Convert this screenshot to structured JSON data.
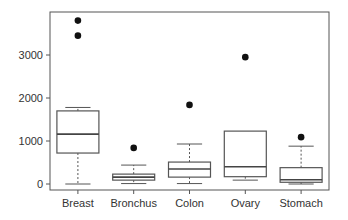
{
  "chart_data": {
    "type": "boxplot",
    "title": "",
    "xlabel": "",
    "ylabel": "",
    "ylim": [
      -120,
      3900
    ],
    "yticks": [
      0,
      1000,
      2000,
      3000
    ],
    "grid": false,
    "legend": null,
    "categories": [
      "Breast",
      "Bronchus",
      "Colon",
      "Ovary",
      "Stomach"
    ],
    "boxes": [
      {
        "name": "Breast",
        "whisker_low": 0,
        "q1": 720,
        "median": 1160,
        "q3": 1700,
        "whisker_high": 1780,
        "outliers": [
          3450,
          3800
        ]
      },
      {
        "name": "Bronchus",
        "whisker_low": 10,
        "q1": 90,
        "median": 160,
        "q3": 230,
        "whisker_high": 440,
        "outliers": [
          840
        ]
      },
      {
        "name": "Colon",
        "whisker_low": 10,
        "q1": 160,
        "median": 350,
        "q3": 510,
        "whisker_high": 930,
        "outliers": [
          1840
        ]
      },
      {
        "name": "Ovary",
        "whisker_low": 90,
        "q1": 170,
        "median": 400,
        "q3": 1230,
        "whisker_high": 1230,
        "outliers": [
          2950
        ]
      },
      {
        "name": "Stomach",
        "whisker_low": 0,
        "q1": 40,
        "median": 100,
        "q3": 380,
        "whisker_high": 880,
        "outliers": [
          1090
        ]
      }
    ]
  },
  "colors": {
    "axis": "#555555",
    "box_stroke": "#555555",
    "outlier": "#111111",
    "text": "#333333"
  }
}
